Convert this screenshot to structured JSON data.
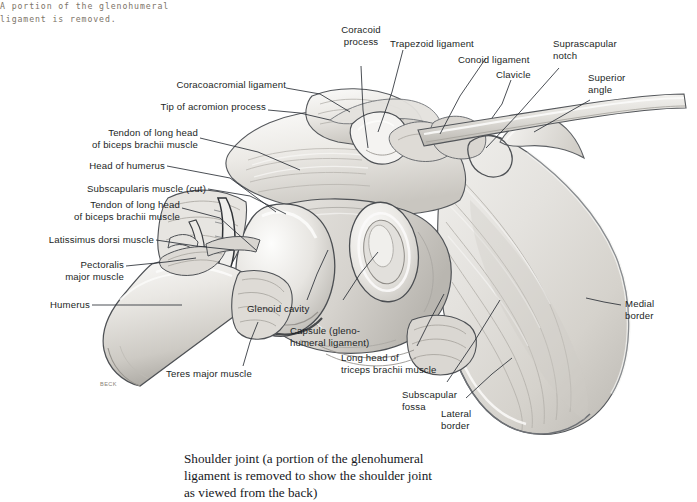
{
  "figure": {
    "type": "anatomical-illustration",
    "artist_signature": "BECK",
    "note": "A portion of the glenohumeral\nligament is removed.",
    "caption": "Shoulder joint (a portion of the glenohumeral\nligament is removed to show the shoulder joint\nas viewed from the back)",
    "colors": {
      "background": "#ffffff",
      "label_text": "#1c1f26",
      "note_text": "#7d7468",
      "caption_text": "#16181d",
      "leader_line": "#2b2f36",
      "bone_light": "#f2f1ef",
      "bone_mid": "#d9d7d2",
      "bone_shadow": "#a9a7a3",
      "outline": "#3a3c40"
    },
    "labels": [
      {
        "id": "coracoacromial-ligament",
        "text": "Coracoacromial ligament"
      },
      {
        "id": "tip-of-acromion-process",
        "text": "Tip of acromion process"
      },
      {
        "id": "tendon-long-head-biceps-upper",
        "text": "Tendon of long head\nof biceps brachii muscle"
      },
      {
        "id": "head-of-humerus",
        "text": "Head of humerus"
      },
      {
        "id": "subscapularis-muscle-cut",
        "text": "Subscapularis muscle (cut)"
      },
      {
        "id": "tendon-long-head-biceps-lower",
        "text": "Tendon of long head\nof biceps brachii muscle"
      },
      {
        "id": "latissimus-dorsi-muscle",
        "text": "Latissimus dorsi muscle"
      },
      {
        "id": "pectoralis-major-muscle",
        "text": "Pectoralis\nmajor muscle"
      },
      {
        "id": "humerus",
        "text": "Humerus"
      },
      {
        "id": "teres-major-muscle",
        "text": "Teres major muscle"
      },
      {
        "id": "coracoid-process",
        "text": "Coracoid\nprocess"
      },
      {
        "id": "trapezoid-ligament",
        "text": "Trapezoid ligament"
      },
      {
        "id": "conoid-ligament",
        "text": "Conoid ligament"
      },
      {
        "id": "clavicle",
        "text": "Clavicle"
      },
      {
        "id": "suprascapular-notch",
        "text": "Suprascapular\nnotch"
      },
      {
        "id": "superior-angle",
        "text": "Superior\nangle"
      },
      {
        "id": "medial-border",
        "text": "Medial\nborder"
      },
      {
        "id": "glenoid-cavity",
        "text": "Glenoid cavity"
      },
      {
        "id": "capsule-glenohumeral-ligament",
        "text": "Capsule (gleno-\nhumeral ligament)"
      },
      {
        "id": "long-head-triceps",
        "text": "Long head of\ntriceps brachii muscle"
      },
      {
        "id": "subscapular-fossa",
        "text": "Subscapular\nfossa"
      },
      {
        "id": "lateral-border",
        "text": "Lateral\nborder"
      }
    ]
  }
}
